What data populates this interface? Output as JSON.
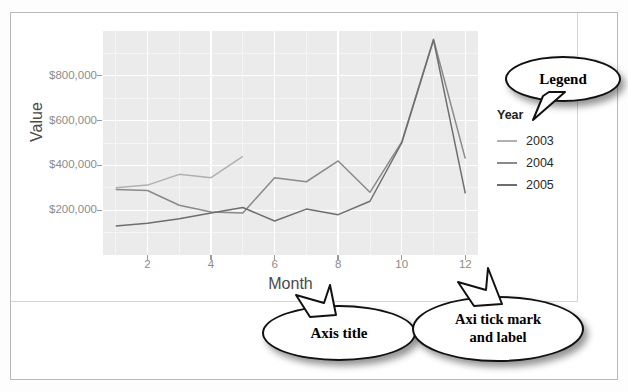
{
  "chart_data": {
    "type": "line",
    "title": "",
    "xlabel": "Month",
    "ylabel": "Value",
    "x": [
      1,
      2,
      3,
      4,
      5,
      6,
      7,
      8,
      9,
      10,
      11,
      12
    ],
    "xlim": [
      0.6,
      12.4
    ],
    "ylim": [
      0,
      1000000
    ],
    "xticks": [
      "2",
      "4",
      "6",
      "8",
      "10",
      "12"
    ],
    "xtick_values": [
      2,
      4,
      6,
      8,
      10,
      12
    ],
    "yticks": [
      "$200,000",
      "$400,000",
      "$600,000",
      "$800,000"
    ],
    "ytick_values": [
      200000,
      400000,
      600000,
      800000
    ],
    "grid": true,
    "legend_position": "right",
    "legend_title": "Year",
    "series": [
      {
        "name": "2003",
        "color": "#b0b0b0",
        "x": [
          1,
          2,
          3,
          4,
          5
        ],
        "values": [
          300000,
          312000,
          360000,
          345000,
          440000
        ]
      },
      {
        "name": "2004",
        "color": "#8a8a8a",
        "x": [
          1,
          2,
          3,
          4,
          5,
          6,
          7,
          8,
          9,
          10,
          11,
          12
        ],
        "values": [
          292000,
          288000,
          222000,
          192000,
          188000,
          345000,
          327000,
          420000,
          280000,
          505000,
          963000,
          430000
        ]
      },
      {
        "name": "2005",
        "color": "#6e6e6e",
        "x": [
          1,
          2,
          3,
          4,
          5,
          6,
          7,
          8,
          9,
          10,
          11,
          12
        ],
        "values": [
          130000,
          142000,
          162000,
          188000,
          212000,
          152000,
          205000,
          180000,
          240000,
          500000,
          960000,
          275000
        ]
      }
    ]
  },
  "figure": {
    "panel_background": "#ebebeb",
    "grid_color": "#ffffff",
    "tick_color": "#8c8c8c",
    "axis_title_color": "#4a4a4a"
  },
  "legend": {
    "title": "Year",
    "items": [
      {
        "label": "2003",
        "color": "#b0b0b0"
      },
      {
        "label": "2004",
        "color": "#8a8a8a"
      },
      {
        "label": "2005",
        "color": "#6e6e6e"
      }
    ]
  },
  "callouts": {
    "legend": {
      "text": "Legend"
    },
    "axis_title": {
      "text": "Axis title"
    },
    "tick": {
      "line1": "Axi tick mark",
      "line2": "and label"
    }
  }
}
